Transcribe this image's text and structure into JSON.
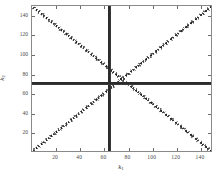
{
  "chart_data": {
    "type": "scatter",
    "title": "",
    "xlabel": "k1",
    "ylabel": "k2",
    "xlabel_base": "k",
    "xlabel_sub": "1",
    "ylabel_base": "k",
    "ylabel_sub": "2",
    "xlim": [
      0,
      150
    ],
    "ylim": [
      150,
      0
    ],
    "y_axis_inverted": true,
    "grid": false,
    "legend": null,
    "xticks": [
      20,
      40,
      60,
      80,
      100,
      120,
      140
    ],
    "yticks": [
      20,
      40,
      60,
      80,
      100,
      120,
      140
    ],
    "xticklabels": [
      "20",
      "40",
      "60",
      "80",
      "100",
      "120",
      "140"
    ],
    "yticklabels": [
      "20",
      "40",
      "60",
      "80",
      "100",
      "120",
      "140"
    ],
    "center": {
      "k1": 75,
      "k2": 75
    },
    "marker_color": "#2b2b2b",
    "background_color": "#ffffff",
    "axis_color": "#8a8a8a",
    "series": [
      {
        "name": "vertical-ridge",
        "description": "dense vertical cluster at k1 = 75 spanning full k2 range",
        "orientation": "vertical",
        "x_constant": 75,
        "y_range": [
          0,
          150
        ],
        "style": "solid-thick"
      },
      {
        "name": "horizontal-ridge",
        "description": "dense horizontal cluster at k2 = 75 spanning full k1 range",
        "orientation": "horizontal",
        "y_constant": 75,
        "x_range": [
          0,
          150
        ],
        "style": "solid-thick"
      },
      {
        "name": "diagonal-positive",
        "description": "dotted diagonal from lower-left to upper-right through center",
        "orientation": "diagonal",
        "points": [
          [
            0,
            150
          ],
          [
            150,
            0
          ]
        ],
        "style": "dash-dot"
      },
      {
        "name": "diagonal-negative",
        "description": "dotted diagonal from upper-left to lower-right through center",
        "orientation": "diagonal",
        "points": [
          [
            0,
            0
          ],
          [
            150,
            150
          ]
        ],
        "style": "dash-dot"
      }
    ]
  }
}
